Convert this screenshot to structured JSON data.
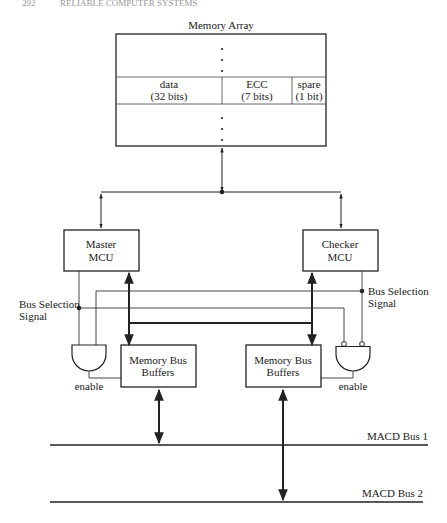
{
  "header": {
    "page_number": "292",
    "running_title": "RELIABLE COMPUTER SYSTEMS"
  },
  "memory_array": {
    "title": "Memory Array",
    "fields": [
      {
        "name": "data",
        "size": "(32 bits)"
      },
      {
        "name": "ECC",
        "size": "(7 bits)"
      },
      {
        "name": "spare",
        "size": "(1 bit)"
      }
    ]
  },
  "master": {
    "line1": "Master",
    "line2": "MCU"
  },
  "checker": {
    "line1": "Checker",
    "line2": "MCU"
  },
  "bus_selection_left": {
    "line1": "Bus Selection",
    "line2": "Signal"
  },
  "bus_selection_right": {
    "line1": "Bus Selection",
    "line2": "Signal"
  },
  "buffers_left": {
    "line1": "Memory Bus",
    "line2": "Buffers"
  },
  "buffers_right": {
    "line1": "Memory Bus",
    "line2": "Buffers"
  },
  "enable_left": "enable",
  "enable_right": "enable",
  "buses": {
    "bus1": "MACD Bus 1",
    "bus2": "MACD Bus 2"
  },
  "colors": {
    "line": "#222222",
    "background": "#ffffff"
  }
}
